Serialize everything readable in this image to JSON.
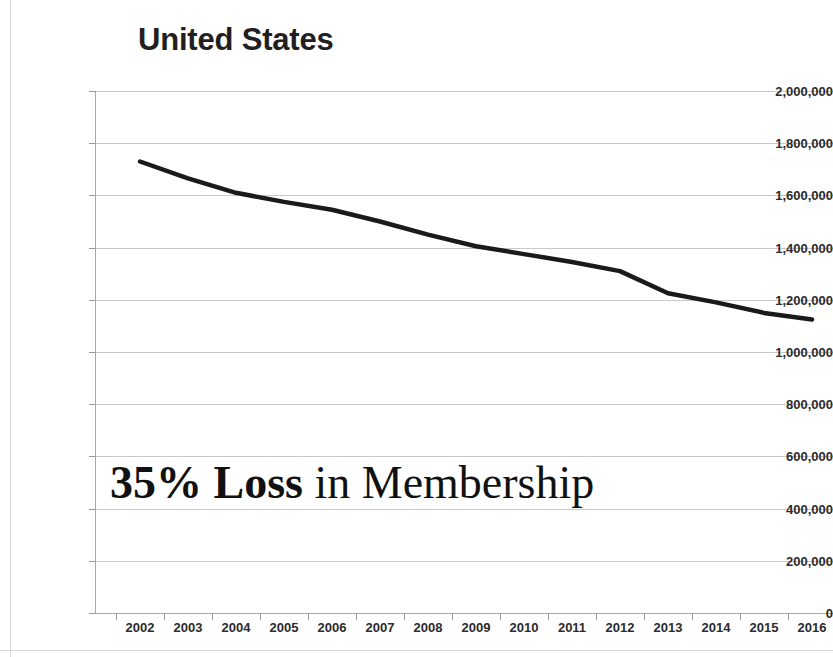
{
  "chart_data": {
    "type": "line",
    "title": "United States",
    "xlabel": "",
    "ylabel": "",
    "grid": true,
    "legend": false,
    "ylim": [
      0,
      2000000
    ],
    "ytick_labels": [
      "2,000,000",
      "1,800,000",
      "1,600,000",
      "1,400,000",
      "1,200,000",
      "1,000,000",
      "800,000",
      "600,000",
      "400,000",
      "200,000",
      "0"
    ],
    "ytick_values": [
      2000000,
      1800000,
      1600000,
      1400000,
      1200000,
      1000000,
      800000,
      600000,
      400000,
      200000,
      0
    ],
    "categories": [
      "2002",
      "2003",
      "2004",
      "2005",
      "2006",
      "2007",
      "2008",
      "2009",
      "2010",
      "2011",
      "2012",
      "2013",
      "2014",
      "2015",
      "2016"
    ],
    "x": [
      2002,
      2003,
      2004,
      2005,
      2006,
      2007,
      2008,
      2009,
      2010,
      2011,
      2012,
      2013,
      2014,
      2015,
      2016
    ],
    "series": [
      {
        "name": "Membership",
        "color": "#1a1a1a",
        "values": [
          1730000,
          1665000,
          1610000,
          1575000,
          1545000,
          1500000,
          1450000,
          1405000,
          1375000,
          1345000,
          1310000,
          1225000,
          1190000,
          1150000,
          1125000
        ]
      }
    ],
    "annotations": [
      {
        "id": "loss-callout",
        "text": "35% Loss in Membership",
        "parts": [
          {
            "text": "35%",
            "bold": true
          },
          {
            "text": " Loss",
            "bold": true
          },
          {
            "text": " in Membership",
            "bold": false
          }
        ]
      }
    ]
  },
  "annotation": {
    "percent": "35%",
    "loss_word": " Loss",
    "rest": " in Membership"
  }
}
